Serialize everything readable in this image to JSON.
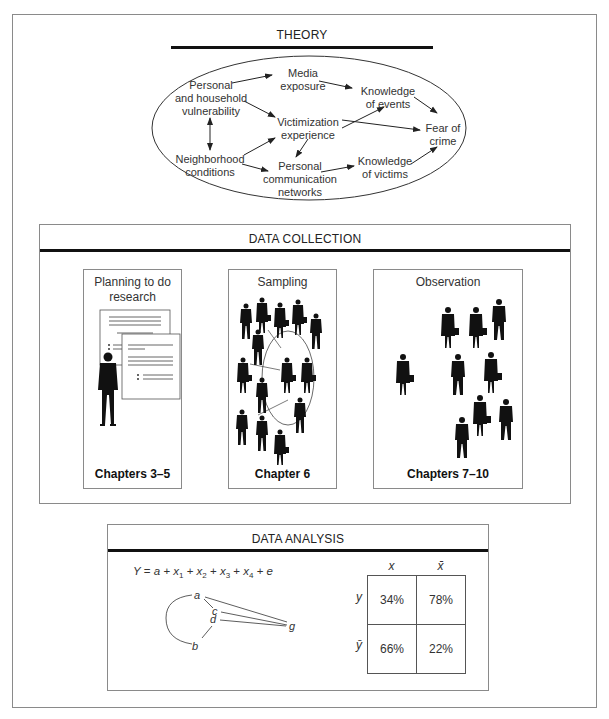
{
  "theory": {
    "title": "THEORY",
    "nodes": {
      "personal_vulnerability": [
        "Personal",
        "and household",
        "vulnerability"
      ],
      "neighborhood": [
        "Neighborhood",
        "conditions"
      ],
      "media": [
        "Media",
        "exposure"
      ],
      "victimization": [
        "Victimization",
        "experience"
      ],
      "communication": [
        "Personal",
        "communication",
        "networks"
      ],
      "knowledge_events": [
        "Knowledge",
        "of events"
      ],
      "knowledge_victims": [
        "Knowledge",
        "of victims"
      ],
      "fear": [
        "Fear of",
        "crime"
      ]
    },
    "edges": [
      [
        "personal_vulnerability",
        "media"
      ],
      [
        "personal_vulnerability",
        "victimization"
      ],
      [
        "personal_vulnerability",
        "neighborhood",
        "bidirectional"
      ],
      [
        "neighborhood",
        "victimization"
      ],
      [
        "neighborhood",
        "communication"
      ],
      [
        "media",
        "knowledge_events"
      ],
      [
        "victimization",
        "knowledge_events"
      ],
      [
        "victimization",
        "fear"
      ],
      [
        "victimization",
        "communication"
      ],
      [
        "communication",
        "knowledge_victims"
      ],
      [
        "knowledge_events",
        "fear"
      ],
      [
        "knowledge_victims",
        "fear"
      ]
    ]
  },
  "data_collection": {
    "title": "DATA COLLECTION",
    "panels": [
      {
        "label": "Planning to do research",
        "label_lines": [
          "Planning to do",
          "research"
        ],
        "chapter": "Chapters 3–5",
        "icon": "documents-and-person-icon"
      },
      {
        "label": "Sampling",
        "chapter": "Chapter 6",
        "icon": "crowd-sample-icon"
      },
      {
        "label": "Observation",
        "chapter": "Chapters 7–10",
        "icon": "crowd-observation-icon"
      }
    ]
  },
  "data_analysis": {
    "title": "DATA ANALYSIS",
    "equation": {
      "lhs": "Y",
      "terms": [
        "a",
        "x1",
        "x2",
        "x3",
        "x4",
        "e"
      ]
    },
    "graph": {
      "nodes": [
        "a",
        "b",
        "c",
        "d",
        "g"
      ],
      "edges": [
        [
          "a",
          "g"
        ],
        [
          "c",
          "g"
        ],
        [
          "d",
          "g"
        ],
        [
          "a",
          "c"
        ],
        [
          "d",
          "b"
        ],
        [
          "a",
          "b",
          "curved"
        ]
      ]
    },
    "crosstab": {
      "col_headers": [
        "x",
        "x̄"
      ],
      "row_headers": [
        "y",
        "ȳ"
      ],
      "cells": [
        [
          "34%",
          "78%"
        ],
        [
          "66%",
          "22%"
        ]
      ]
    }
  }
}
